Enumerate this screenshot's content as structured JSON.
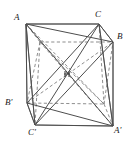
{
  "figure": {
    "kind": "geometry-diagram",
    "stroke_color": "#555555",
    "hidden_stroke_color": "#777777",
    "background": "#ffffff",
    "label_color": "#1a1a1a"
  },
  "labels": [
    {
      "id": "A",
      "text": "A",
      "x": 14,
      "y": 13
    },
    {
      "id": "C",
      "text": "C",
      "x": 95,
      "y": 10
    },
    {
      "id": "B",
      "text": "B",
      "x": 117,
      "y": 32
    },
    {
      "id": "Bp",
      "text": "B'",
      "x": 5,
      "y": 98
    },
    {
      "id": "Cp",
      "text": "C'",
      "x": 28,
      "y": 128
    },
    {
      "id": "Ap",
      "text": "A'",
      "x": 114,
      "y": 126
    }
  ],
  "vertices": {
    "front_top_left": {
      "name": "A",
      "x": 26,
      "y": 24
    },
    "front_top_right": {
      "name": "C",
      "x": 99,
      "y": 24
    },
    "back_top_right": {
      "name": "B",
      "x": 113,
      "y": 42
    },
    "back_top_left": {
      "name": "T",
      "x": 40,
      "y": 42
    },
    "front_bottom_left": {
      "name": "C'",
      "x": 35,
      "y": 125
    },
    "front_bottom_right": {
      "name": "A'",
      "x": 113,
      "y": 126
    },
    "back_bottom_left": {
      "name": "B'",
      "x": 27,
      "y": 103
    },
    "back_bottom_right": {
      "name": "Q",
      "x": 104,
      "y": 104
    },
    "center": {
      "name": "O",
      "x": 67,
      "y": 74
    }
  },
  "edges_solid": [
    "A-C",
    "C-B",
    "B-A'",
    "A'-C'",
    "C'-A",
    "A-B",
    "A-C'",
    "C-A'",
    "A-A'",
    "C-C'",
    "B-C'",
    "A-B'",
    "C-B'",
    "B'-C'",
    "B'-A'"
  ],
  "edges_hidden": [
    "A-Q",
    "C-Q",
    "Q-B'",
    "Q-A'",
    "Q-B",
    "T-A",
    "T-B",
    "T-B'",
    "T-A'",
    "T-C'"
  ],
  "center_mark": {
    "label": "center-point",
    "size": 5
  }
}
